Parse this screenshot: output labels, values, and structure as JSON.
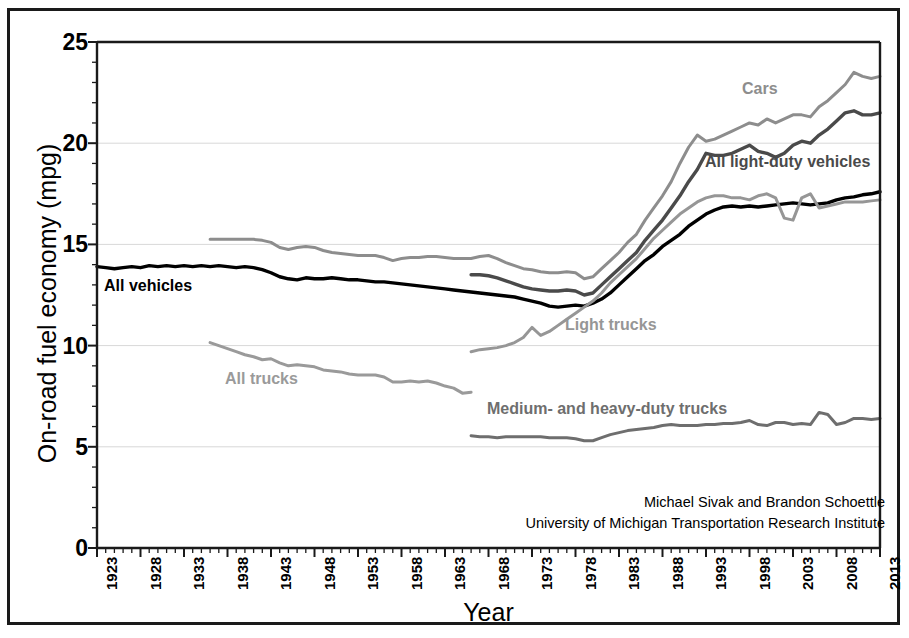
{
  "chart_data": {
    "type": "line",
    "title": "",
    "xlabel": "Year",
    "ylabel": "On-road fuel economy (mpg)",
    "xlim": [
      1923,
      2013
    ],
    "ylim": [
      0,
      25
    ],
    "grid": "horizontal-major",
    "legend": "inline-labels",
    "y_ticks": [
      "0",
      "5",
      "10",
      "15",
      "20",
      "25"
    ],
    "y_tick_values": [
      0,
      5,
      10,
      15,
      20,
      25
    ],
    "y_minor_tick_step": 1,
    "x_ticks": [
      "1923",
      "1928",
      "1933",
      "1938",
      "1943",
      "1948",
      "1953",
      "1958",
      "1963",
      "1968",
      "1973",
      "1978",
      "1983",
      "1988",
      "1993",
      "1998",
      "2003",
      "2008",
      "2013"
    ],
    "x_tick_values": [
      1923,
      1928,
      1933,
      1938,
      1943,
      1948,
      1953,
      1958,
      1963,
      1968,
      1973,
      1978,
      1983,
      1988,
      1993,
      1998,
      2003,
      2008,
      2013
    ],
    "x_minor_tick_step": 1,
    "series": [
      {
        "name": "All vehicles",
        "label": "All vehicles",
        "color": "#000000",
        "width": 3.4,
        "x_start": 1923,
        "x": [
          1923,
          1924,
          1925,
          1926,
          1927,
          1928,
          1929,
          1930,
          1931,
          1932,
          1933,
          1934,
          1935,
          1936,
          1937,
          1938,
          1939,
          1940,
          1941,
          1942,
          1943,
          1944,
          1945,
          1946,
          1947,
          1948,
          1949,
          1950,
          1951,
          1952,
          1953,
          1954,
          1955,
          1956,
          1957,
          1958,
          1959,
          1960,
          1961,
          1962,
          1963,
          1964,
          1965,
          1966,
          1967,
          1968,
          1969,
          1970,
          1971,
          1972,
          1973,
          1974,
          1975,
          1976,
          1977,
          1978,
          1979,
          1980,
          1981,
          1982,
          1983,
          1984,
          1985,
          1986,
          1987,
          1988,
          1989,
          1990,
          1991,
          1992,
          1993,
          1994,
          1995,
          1996,
          1997,
          1998,
          1999,
          2000,
          2001,
          2002,
          2003,
          2004,
          2005,
          2006,
          2007,
          2008,
          2009,
          2010,
          2011,
          2012,
          2013
        ],
        "values": [
          13.9,
          13.85,
          13.8,
          13.85,
          13.9,
          13.85,
          13.95,
          13.9,
          13.95,
          13.9,
          13.95,
          13.9,
          13.95,
          13.9,
          13.95,
          13.9,
          13.85,
          13.9,
          13.85,
          13.75,
          13.6,
          13.4,
          13.3,
          13.25,
          13.35,
          13.3,
          13.3,
          13.35,
          13.3,
          13.25,
          13.25,
          13.2,
          13.15,
          13.15,
          13.1,
          13.05,
          13.0,
          12.95,
          12.9,
          12.85,
          12.8,
          12.75,
          12.7,
          12.65,
          12.6,
          12.55,
          12.5,
          12.45,
          12.4,
          12.3,
          12.2,
          12.1,
          11.95,
          11.9,
          11.95,
          12.0,
          11.95,
          12.1,
          12.3,
          12.6,
          13.0,
          13.4,
          13.8,
          14.2,
          14.5,
          14.9,
          15.2,
          15.5,
          15.9,
          16.2,
          16.5,
          16.7,
          16.85,
          16.9,
          16.85,
          16.9,
          16.85,
          16.9,
          16.95,
          17.0,
          17.05,
          17.0,
          16.95,
          17.0,
          17.05,
          17.2,
          17.3,
          17.35,
          17.45,
          17.5,
          17.6
        ]
      },
      {
        "name": "All trucks",
        "label": "All trucks",
        "color": "#9a9a9a",
        "width": 3.0,
        "x_start": 1936,
        "x": [
          1936,
          1937,
          1938,
          1939,
          1940,
          1941,
          1942,
          1943,
          1944,
          1945,
          1946,
          1947,
          1948,
          1949,
          1950,
          1951,
          1952,
          1953,
          1954,
          1955,
          1956,
          1957,
          1958,
          1959,
          1960,
          1961,
          1962,
          1963,
          1964,
          1965,
          1966
        ],
        "values": [
          10.15,
          10.0,
          9.85,
          9.7,
          9.55,
          9.45,
          9.3,
          9.35,
          9.15,
          9.0,
          9.05,
          9.0,
          8.95,
          8.8,
          8.75,
          8.7,
          8.6,
          8.55,
          8.55,
          8.55,
          8.45,
          8.2,
          8.2,
          8.25,
          8.2,
          8.25,
          8.15,
          8.0,
          7.9,
          7.65,
          7.7
        ]
      },
      {
        "name": "Cars",
        "label": "Cars",
        "color": "#8d8d8d",
        "width": 3.0,
        "x_start": 1936,
        "x": [
          1936,
          1937,
          1938,
          1939,
          1940,
          1941,
          1942,
          1943,
          1944,
          1945,
          1946,
          1947,
          1948,
          1949,
          1950,
          1951,
          1952,
          1953,
          1954,
          1955,
          1956,
          1957,
          1958,
          1959,
          1960,
          1961,
          1962,
          1963,
          1964,
          1965,
          1966,
          1967,
          1968,
          1969,
          1970,
          1971,
          1972,
          1973,
          1974,
          1975,
          1976,
          1977,
          1978,
          1979,
          1980,
          1981,
          1982,
          1983,
          1984,
          1985,
          1986,
          1987,
          1988,
          1989,
          1990,
          1991,
          1992,
          1993,
          1994,
          1995,
          1996,
          1997,
          1998,
          1999,
          2000,
          2001,
          2002,
          2003,
          2004,
          2005,
          2006,
          2007,
          2008,
          2009,
          2010,
          2011,
          2012,
          2013
        ],
        "values": [
          15.25,
          15.25,
          15.25,
          15.25,
          15.25,
          15.25,
          15.2,
          15.1,
          14.85,
          14.75,
          14.85,
          14.9,
          14.85,
          14.7,
          14.6,
          14.55,
          14.5,
          14.45,
          14.45,
          14.45,
          14.35,
          14.2,
          14.3,
          14.35,
          14.35,
          14.4,
          14.4,
          14.35,
          14.3,
          14.3,
          14.3,
          14.4,
          14.45,
          14.3,
          14.1,
          13.95,
          13.8,
          13.75,
          13.65,
          13.6,
          13.6,
          13.65,
          13.6,
          13.3,
          13.4,
          13.8,
          14.2,
          14.6,
          15.1,
          15.5,
          16.2,
          16.8,
          17.4,
          18.1,
          19.0,
          19.8,
          20.4,
          20.1,
          20.2,
          20.4,
          20.6,
          20.8,
          21.0,
          20.9,
          21.2,
          21.0,
          21.2,
          21.4,
          21.4,
          21.3,
          21.8,
          22.1,
          22.5,
          22.9,
          23.5,
          23.3,
          23.2,
          23.3
        ]
      },
      {
        "name": "All light-duty vehicles",
        "label": "All light-duty vehicles",
        "color": "#4a4a4a",
        "width": 3.4,
        "x_start": 1966,
        "x": [
          1966,
          1967,
          1968,
          1969,
          1970,
          1971,
          1972,
          1973,
          1974,
          1975,
          1976,
          1977,
          1978,
          1979,
          1980,
          1981,
          1982,
          1983,
          1984,
          1985,
          1986,
          1987,
          1988,
          1989,
          1990,
          1991,
          1992,
          1993,
          1994,
          1995,
          1996,
          1997,
          1998,
          1999,
          2000,
          2001,
          2002,
          2003,
          2004,
          2005,
          2006,
          2007,
          2008,
          2009,
          2010,
          2011,
          2012,
          2013
        ],
        "values": [
          13.5,
          13.5,
          13.45,
          13.35,
          13.2,
          13.05,
          12.9,
          12.8,
          12.75,
          12.7,
          12.7,
          12.75,
          12.7,
          12.5,
          12.6,
          13.0,
          13.4,
          13.8,
          14.2,
          14.6,
          15.2,
          15.7,
          16.2,
          16.8,
          17.4,
          18.1,
          18.7,
          19.5,
          19.4,
          19.4,
          19.5,
          19.7,
          19.9,
          19.6,
          19.5,
          19.3,
          19.5,
          19.9,
          20.1,
          20.0,
          20.4,
          20.7,
          21.1,
          21.5,
          21.6,
          21.4,
          21.4,
          21.5
        ]
      },
      {
        "name": "Light trucks",
        "label": "Light trucks",
        "color": "#969696",
        "width": 3.0,
        "x_start": 1966,
        "x": [
          1966,
          1967,
          1968,
          1969,
          1970,
          1971,
          1972,
          1973,
          1974,
          1975,
          1976,
          1977,
          1978,
          1979,
          1980,
          1981,
          1982,
          1983,
          1984,
          1985,
          1986,
          1987,
          1988,
          1989,
          1990,
          1991,
          1992,
          1993,
          1994,
          1995,
          1996,
          1997,
          1998,
          1999,
          2000,
          2001,
          2002,
          2003,
          2004,
          2005,
          2006,
          2007,
          2008,
          2009,
          2010,
          2011,
          2012,
          2013
        ],
        "values": [
          9.7,
          9.8,
          9.85,
          9.9,
          10.0,
          10.15,
          10.4,
          10.9,
          10.5,
          10.7,
          11.0,
          11.3,
          11.6,
          11.9,
          12.2,
          12.6,
          13.1,
          13.5,
          13.9,
          14.3,
          14.8,
          15.3,
          15.7,
          16.1,
          16.5,
          16.8,
          17.1,
          17.3,
          17.4,
          17.4,
          17.3,
          17.3,
          17.2,
          17.4,
          17.5,
          17.3,
          16.3,
          16.2,
          17.3,
          17.5,
          16.8,
          16.9,
          17.0,
          17.1,
          17.1,
          17.1,
          17.15,
          17.2
        ]
      },
      {
        "name": "Medium- and heavy-duty trucks",
        "label": "Medium- and heavy-duty trucks",
        "color": "#6e6e6e",
        "width": 3.0,
        "x_start": 1966,
        "x": [
          1966,
          1967,
          1968,
          1969,
          1970,
          1971,
          1972,
          1973,
          1974,
          1975,
          1976,
          1977,
          1978,
          1979,
          1980,
          1981,
          1982,
          1983,
          1984,
          1985,
          1986,
          1987,
          1988,
          1989,
          1990,
          1991,
          1992,
          1993,
          1994,
          1995,
          1996,
          1997,
          1998,
          1999,
          2000,
          2001,
          2002,
          2003,
          2004,
          2005,
          2006,
          2007,
          2008,
          2009,
          2010,
          2011,
          2012,
          2013
        ],
        "values": [
          5.55,
          5.5,
          5.5,
          5.45,
          5.5,
          5.5,
          5.5,
          5.5,
          5.5,
          5.45,
          5.45,
          5.45,
          5.4,
          5.3,
          5.3,
          5.45,
          5.6,
          5.7,
          5.8,
          5.85,
          5.9,
          5.95,
          6.05,
          6.1,
          6.05,
          6.05,
          6.05,
          6.1,
          6.1,
          6.15,
          6.15,
          6.2,
          6.3,
          6.1,
          6.05,
          6.2,
          6.2,
          6.1,
          6.15,
          6.1,
          6.7,
          6.6,
          6.1,
          6.2,
          6.4,
          6.4,
          6.35,
          6.4
        ]
      }
    ],
    "annotations": {
      "attribution_line1": "Michael Sivak and Brandon Schoettle",
      "attribution_line2": "University of Michigan Transportation Research Institute"
    },
    "colors": {
      "axis": "#1a1a1a",
      "gridline": "#d8d8d8",
      "frame": "#1a1a1a",
      "background": "#ffffff"
    }
  }
}
